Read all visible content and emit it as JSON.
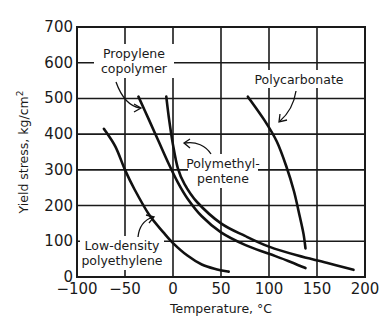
{
  "chart_data": {
    "type": "line",
    "title": "",
    "xlabel": "Temperature, °C",
    "ylabel": "Yield stress, kg/cm²",
    "xlim": [
      -100,
      200
    ],
    "ylim": [
      0,
      700
    ],
    "x_ticks": [
      -100,
      -50,
      0,
      50,
      100,
      150,
      200
    ],
    "y_ticks": [
      0,
      100,
      200,
      300,
      400,
      500,
      600,
      700
    ],
    "x_tick_labels": [
      "−100",
      "−50",
      "0",
      "50",
      "100",
      "150",
      "200"
    ],
    "y_tick_labels": [
      "0",
      "100",
      "200",
      "300",
      "400",
      "500",
      "600",
      "700"
    ],
    "grid": true,
    "legend": "none (curves labeled directly with annotations)",
    "series": [
      {
        "name": "Low-density polyethylene",
        "points": [
          [
            -72,
            415
          ],
          [
            -60,
            365
          ],
          [
            -50,
            300
          ],
          [
            -40,
            245
          ],
          [
            -25,
            175
          ],
          [
            -10,
            125
          ],
          [
            0,
            95
          ],
          [
            15,
            60
          ],
          [
            30,
            35
          ],
          [
            45,
            22
          ],
          [
            58,
            15
          ]
        ]
      },
      {
        "name": "Propylene copolymer",
        "points": [
          [
            -36,
            505
          ],
          [
            -25,
            440
          ],
          [
            -15,
            380
          ],
          [
            -5,
            320
          ],
          [
            5,
            265
          ],
          [
            15,
            220
          ],
          [
            30,
            170
          ],
          [
            50,
            125
          ],
          [
            75,
            90
          ],
          [
            100,
            65
          ],
          [
            120,
            45
          ],
          [
            138,
            25
          ]
        ]
      },
      {
        "name": "Polymethylpentene",
        "points": [
          [
            -7,
            505
          ],
          [
            -4,
            440
          ],
          [
            0,
            370
          ],
          [
            5,
            305
          ],
          [
            12,
            260
          ],
          [
            25,
            210
          ],
          [
            50,
            150
          ],
          [
            75,
            115
          ],
          [
            100,
            85
          ],
          [
            130,
            60
          ],
          [
            160,
            40
          ],
          [
            188,
            20
          ]
        ]
      },
      {
        "name": "Polycarbonate",
        "points": [
          [
            78,
            505
          ],
          [
            95,
            440
          ],
          [
            108,
            380
          ],
          [
            118,
            310
          ],
          [
            126,
            240
          ],
          [
            132,
            170
          ],
          [
            136,
            120
          ],
          [
            138,
            80
          ]
        ]
      }
    ],
    "annotations": [
      {
        "text": "Propylene copolymer",
        "lines": [
          "Propylene",
          "copolymer"
        ]
      },
      {
        "text": "Polycarbonate",
        "lines": [
          "Polycarbonate"
        ]
      },
      {
        "text": "Polymethylpentene",
        "lines": [
          "Polymethyl-",
          "pentene"
        ]
      },
      {
        "text": "Low-density polyethylene",
        "lines": [
          "Low-density",
          "polyethylene"
        ]
      }
    ]
  },
  "labels": {
    "xlabel": "Temperature, °C",
    "ylabel_main": "Yield stress, kg/cm",
    "ylabel_sup": "2",
    "ann_pc_1": "Propylene",
    "ann_pc_2": "copolymer",
    "ann_polycarb": "Polycarbonate",
    "ann_pmp_1": "Polymethyl-",
    "ann_pmp_2": "pentene",
    "ann_ldpe_1": "Low-density",
    "ann_ldpe_2": "polyethylene"
  }
}
